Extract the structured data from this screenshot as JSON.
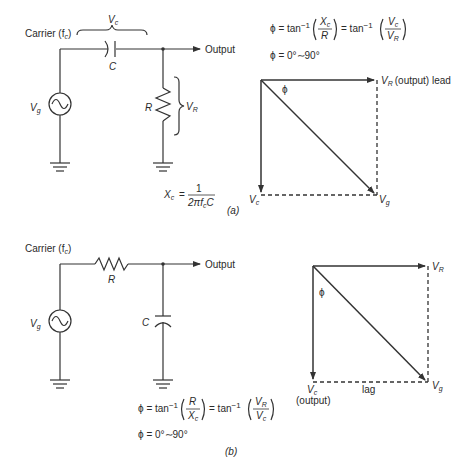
{
  "figure": {
    "part_a": {
      "caption": "(a)",
      "circuit": {
        "type": "RC high-pass (series C, shunt R)",
        "carrier_label": "Carrier (f",
        "carrier_sub": "c",
        "carrier_close": ")",
        "source_label": "V",
        "source_sub": "g",
        "series_component": "C",
        "series_voltage_label": "V",
        "series_voltage_sub": "c",
        "shunt_component": "R",
        "shunt_voltage_label": "V",
        "shunt_voltage_sub": "R",
        "output_label": "Output"
      },
      "equations": {
        "phi_eq_prefix": "ϕ = tan",
        "inv": "−1",
        "frac1_num": "X",
        "frac1_num_sub": "c",
        "frac1_den": "R",
        "eq_mid": "= tan",
        "frac2_num": "V",
        "frac2_num_sub": "c",
        "frac2_den": "V",
        "frac2_den_sub": "R",
        "range": "ϕ = 0°∼90°",
        "xc_lhs": "X",
        "xc_lhs_sub": "c",
        "xc_eq": "=",
        "xc_num": "1",
        "xc_den": "2πf",
        "xc_den_sub": "c",
        "xc_den_tail": "C"
      },
      "phasor": {
        "vr_label": "V",
        "vr_sub": "R",
        "vr_note": "(output) lead",
        "vc_label": "V",
        "vc_sub": "c",
        "vg_label": "V",
        "vg_sub": "g",
        "angle_label": "ϕ"
      }
    },
    "part_b": {
      "caption": "(b)",
      "circuit": {
        "type": "RC low-pass (series R, shunt C)",
        "carrier_label": "Carrier (f",
        "carrier_sub": "c",
        "carrier_close": ")",
        "source_label": "V",
        "source_sub": "g",
        "series_component": "R",
        "shunt_component": "C",
        "output_label": "Output"
      },
      "equations": {
        "phi_eq_prefix": "ϕ = tan",
        "inv": "−1",
        "frac1_num": "R",
        "frac1_den": "X",
        "frac1_den_sub": "c",
        "eq_mid": "= tan",
        "frac2_num": "V",
        "frac2_num_sub": "R",
        "frac2_den": "V",
        "frac2_den_sub": "c",
        "range": "ϕ = 0°∼90°"
      },
      "phasor": {
        "vr_label": "V",
        "vr_sub": "R",
        "vc_label": "V",
        "vc_sub": "c",
        "vc_note": "(output)",
        "vg_label": "V",
        "vg_sub": "g",
        "angle_label": "ϕ",
        "lag_label": "lag"
      }
    }
  }
}
